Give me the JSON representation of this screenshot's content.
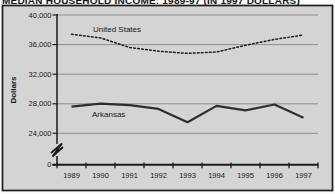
{
  "title": "MEDIAN HOUSEHOLD INCOME: 1989-97 (IN 1997 DOLLARS)",
  "chart_data": {
    "type": "line",
    "title": "MEDIAN HOUSEHOLD INCOME: 1989-97 (IN 1997 DOLLARS)",
    "xlabel": "",
    "ylabel": "Dollars",
    "x": [
      1989,
      1990,
      1991,
      1992,
      1993,
      1994,
      1995,
      1996,
      1997
    ],
    "series": [
      {
        "name": "United States",
        "line_style": "dotted",
        "color": "#1b1b1b",
        "values": [
          37400,
          36900,
          35600,
          35100,
          34800,
          35000,
          35900,
          36700,
          37300
        ]
      },
      {
        "name": "Arkansas",
        "line_style": "solid",
        "color": "#2e2e2e",
        "values": [
          27600,
          28000,
          27800,
          27300,
          25500,
          27700,
          27100,
          27900,
          26100
        ]
      }
    ],
    "y_tick_labels": [
      "40,000",
      "36,000",
      "32,000",
      "28,000",
      "24,000"
    ],
    "y_zero_label": "0",
    "y_axis_break": true,
    "ylim": [
      24000,
      40000
    ],
    "grid": "horizontal",
    "legend": "inline-labels",
    "plot_bg": "#d4d4d4"
  },
  "colors": {
    "figure_bg": "#d4d4d4",
    "frame_border": "#1d1d1d",
    "gridline": "#8e8e8e",
    "axis": "#1b1b1b",
    "text": "#161616"
  }
}
